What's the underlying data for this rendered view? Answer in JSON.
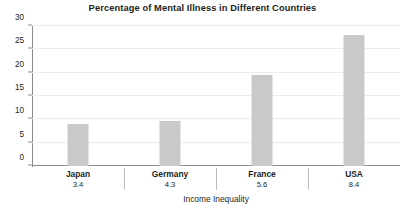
{
  "chart_data": {
    "type": "bar",
    "title": "Percentage of Mental Illness in Different Countries",
    "xlabel": "Income Inequality",
    "ylabel": "",
    "categories": [
      "Japan",
      "Germany",
      "France",
      "USA"
    ],
    "category_values": [
      "3.4",
      "4.3",
      "5.6",
      "8.4"
    ],
    "values": [
      9,
      9.6,
      19.5,
      28
    ],
    "ylim": [
      0,
      30
    ],
    "yticks": [
      0,
      5,
      10,
      15,
      20,
      25,
      30
    ],
    "ytick_labels": [
      "0",
      "5",
      "10",
      "15",
      "20",
      "25",
      "30"
    ],
    "grid": true,
    "legend": false,
    "bar_color": "#c9c9c9",
    "gridline_color": "#ececec",
    "axis_color": "#8c8c8c",
    "text_color": "#231f20"
  }
}
